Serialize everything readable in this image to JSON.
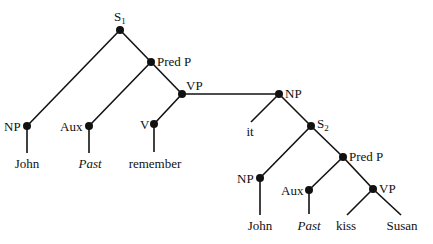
{
  "diagram": {
    "type": "syntax-tree",
    "nodes": {
      "s1": {
        "label": "S",
        "subscript": "1"
      },
      "predp1": {
        "label": "Pred P"
      },
      "np1": {
        "label": "NP"
      },
      "aux1": {
        "label": "Aux"
      },
      "vp1": {
        "label": "VP"
      },
      "v1": {
        "label": "V"
      },
      "np2": {
        "label": "NP"
      },
      "s2": {
        "label": "S",
        "subscript": "2"
      },
      "np3": {
        "label": "NP"
      },
      "predp2": {
        "label": "Pred P"
      },
      "aux2": {
        "label": "Aux"
      },
      "vp2": {
        "label": "VP"
      }
    },
    "leaves": {
      "john1": "John",
      "past1": "Past",
      "remember": "remember",
      "it": "it",
      "john2": "John",
      "past2": "Past",
      "kiss": "kiss",
      "susan": "Susan"
    },
    "edges": [
      [
        "S1",
        "NP"
      ],
      [
        "S1",
        "Pred P"
      ],
      [
        "Pred P",
        "Aux"
      ],
      [
        "Pred P",
        "VP"
      ],
      [
        "NP",
        "John"
      ],
      [
        "Aux",
        "Past"
      ],
      [
        "VP",
        "V"
      ],
      [
        "VP",
        "NP(2)"
      ],
      [
        "V",
        "remember"
      ],
      [
        "NP(2)",
        "it"
      ],
      [
        "NP(2)",
        "S2"
      ],
      [
        "S2",
        "NP(3)"
      ],
      [
        "S2",
        "Pred P(2)"
      ],
      [
        "NP(3)",
        "John"
      ],
      [
        "Pred P(2)",
        "Aux(2)"
      ],
      [
        "Pred P(2)",
        "VP(2)"
      ],
      [
        "Aux(2)",
        "Past"
      ],
      [
        "VP(2)",
        "kiss"
      ],
      [
        "VP(2)",
        "Susan"
      ]
    ]
  }
}
